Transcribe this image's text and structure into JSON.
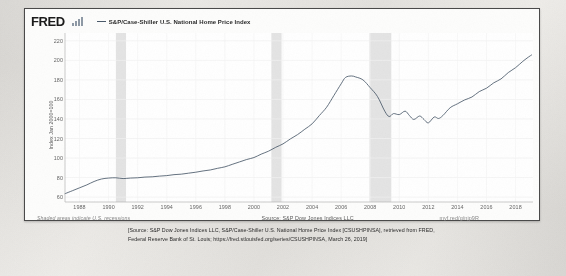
{
  "brand": {
    "logo_text": "FRED",
    "logo_icon": "bar-chart-icon"
  },
  "legend": {
    "series_label": "S&P/Case-Shiller U.S. National Home Price Index",
    "line_color": "#4a5a6a"
  },
  "notes": {
    "recession_note": "Shaded areas indicate U.S. recessions",
    "source": "Source: S&P Dow Jones Indices LLC",
    "short_url": "myf.red/g/njp9R"
  },
  "caption": {
    "line1": "[Source: S&P Dow Jones Indices LLC, S&P/Case-Shiller U.S. National Home Price Index [CSUSHPINSA], retrieved from FRED,",
    "line2": "Federal Reserve Bank of St. Louis; https://fred.stlouisfed.org/series/CSUSHPINSA, March 26, 2019]"
  },
  "chart_data": {
    "type": "line",
    "title": "",
    "xlabel": "",
    "ylabel": "Index Jan 2000=100",
    "ylim": [
      55,
      228
    ],
    "xlim": [
      1987.0,
      2019.2
    ],
    "yticks": [
      220,
      200,
      180,
      160,
      140,
      120,
      100,
      80,
      60
    ],
    "xticks": [
      1988,
      1990,
      1992,
      1994,
      1996,
      1998,
      2000,
      2002,
      2004,
      2006,
      2008,
      2010,
      2012,
      2014,
      2016,
      2018
    ],
    "grid": true,
    "legend_position": "top",
    "series": [
      {
        "name": "S&P/Case-Shiller U.S. National Home Price Index",
        "color": "#4a5a6a",
        "x": [
          1987.0,
          1987.5,
          1988.0,
          1988.5,
          1989.0,
          1989.5,
          1990.0,
          1990.5,
          1991.0,
          1991.5,
          1992.0,
          1992.5,
          1993.0,
          1993.5,
          1994.0,
          1994.5,
          1995.0,
          1995.5,
          1996.0,
          1996.5,
          1997.0,
          1997.5,
          1998.0,
          1998.5,
          1999.0,
          1999.5,
          2000.0,
          2000.5,
          2001.0,
          2001.5,
          2002.0,
          2002.5,
          2003.0,
          2003.5,
          2004.0,
          2004.5,
          2005.0,
          2005.5,
          2006.0,
          2006.3,
          2006.7,
          2007.0,
          2007.5,
          2008.0,
          2008.5,
          2009.0,
          2009.3,
          2009.6,
          2010.0,
          2010.4,
          2010.7,
          2011.0,
          2011.4,
          2011.7,
          2012.0,
          2012.4,
          2012.7,
          2013.0,
          2013.5,
          2014.0,
          2014.5,
          2015.0,
          2015.5,
          2016.0,
          2016.5,
          2017.0,
          2017.5,
          2018.0,
          2018.5,
          2018.9,
          2019.1
        ],
        "y": [
          63.5,
          66.5,
          69.5,
          72.5,
          76.0,
          78.5,
          79.5,
          79.8,
          79.0,
          79.5,
          79.8,
          80.5,
          80.8,
          81.5,
          82.0,
          83.0,
          83.5,
          84.5,
          85.5,
          86.8,
          87.8,
          89.5,
          91.0,
          93.5,
          96.0,
          98.5,
          100.5,
          104.0,
          107.0,
          111.0,
          114.5,
          119.5,
          124.0,
          129.5,
          135.0,
          143.5,
          152.0,
          164.0,
          176.0,
          182.5,
          184.0,
          183.0,
          180.0,
          172.0,
          163.0,
          148.0,
          142.5,
          145.5,
          144.5,
          148.0,
          143.5,
          139.5,
          143.0,
          139.5,
          136.0,
          142.0,
          140.5,
          143.5,
          151.5,
          155.5,
          159.5,
          162.5,
          168.0,
          171.5,
          177.0,
          181.0,
          187.5,
          192.5,
          199.0,
          203.5,
          205.5
        ]
      }
    ],
    "recessions": [
      {
        "start": 1990.5,
        "end": 1991.2
      },
      {
        "start": 2001.2,
        "end": 2001.9
      },
      {
        "start": 2007.95,
        "end": 2009.45
      }
    ],
    "recession_color": "#e4e4e4"
  }
}
